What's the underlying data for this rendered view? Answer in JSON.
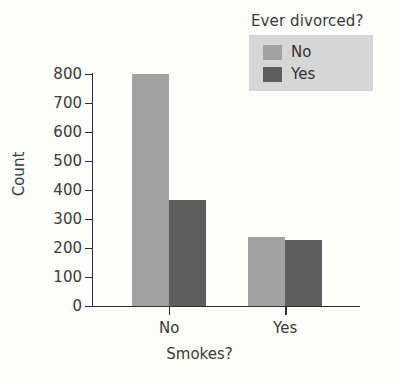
{
  "chart_data": {
    "type": "bar",
    "title": "",
    "xlabel": "Smokes?",
    "ylabel": "Count",
    "categories": [
      "No",
      "Yes"
    ],
    "series": [
      {
        "name": "No",
        "values": [
          800,
          238
        ],
        "color": "#a2a2a2"
      },
      {
        "name": "Yes",
        "values": [
          365,
          228
        ],
        "color": "#5e5e5e"
      }
    ],
    "legend": {
      "title": "Ever divorced?",
      "position": "top-right",
      "background": "#d6d6d6",
      "entries": [
        {
          "label": "No",
          "color": "#a2a2a2"
        },
        {
          "label": "Yes",
          "color": "#5e5e5e"
        }
      ]
    },
    "ylim": [
      0,
      800
    ],
    "yticks": [
      0,
      100,
      200,
      300,
      400,
      500,
      600,
      700,
      800
    ],
    "ytick_labels": [
      "0",
      "100",
      "200",
      "300",
      "400",
      "500",
      "600",
      "700",
      "800"
    ],
    "xtick_labels": [
      "No",
      "Yes"
    ],
    "grid": false,
    "axis_color": "#2e2e2e",
    "background": "#fdfdfb"
  }
}
